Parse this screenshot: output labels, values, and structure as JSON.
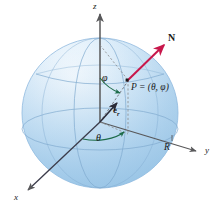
{
  "figure": {
    "name": "spherical-coordinate-sphere",
    "type": "diagram",
    "width": 218,
    "height": 217,
    "background": "#ffffff"
  },
  "colors": {
    "sphere_light": "#f2f8fd",
    "sphere_mid": "#cfe4f5",
    "sphere_deep": "#a9cdea",
    "sphere_edge": "#8fb9de",
    "grid_line": "#7fa9cf",
    "axis": "#58585a",
    "normal_vector": "#c8174b",
    "angle_arc": "#1d6b49",
    "label_text": "#1a1a1a",
    "dashed": "#8a8a8c"
  },
  "axes": [
    {
      "id": "z",
      "label": "z",
      "direction": "up",
      "label_x": 93,
      "label_y": 3
    },
    {
      "id": "y",
      "label": "y",
      "direction": "right-down",
      "label_x": 205,
      "label_y": 150
    },
    {
      "id": "x",
      "label": "x",
      "direction": "left-down",
      "label_x": 14,
      "label_y": 196
    }
  ],
  "labels": {
    "point": "P = (θ, φ)",
    "point_x": 130,
    "point_y": 86,
    "normal": "N",
    "normal_x": 168,
    "normal_y": 36,
    "unit_vector": "e",
    "unit_vector_sub": "r",
    "unit_vector_x": 112,
    "unit_vector_y": 109,
    "phi": "φ",
    "phi_x": 102,
    "phi_y": 78,
    "theta": "θ",
    "theta_x": 96,
    "theta_y": 136,
    "radius": "R",
    "radius_x": 164,
    "radius_y": 145
  },
  "geometry": {
    "sphere_center_x": 100,
    "sphere_center_y": 113,
    "sphere_radius_x": 78,
    "sphere_radius_y": 75,
    "origin_x": 100,
    "origin_y": 122,
    "point_p_x": 128,
    "point_p_y": 80,
    "normal_tip_x": 163,
    "normal_tip_y": 44
  },
  "elements": [
    {
      "name": "sphere-body",
      "kind": "shape"
    },
    {
      "name": "equator-ellipse",
      "kind": "grid"
    },
    {
      "name": "meridian-front",
      "kind": "grid"
    },
    {
      "name": "meridian-side",
      "kind": "grid"
    },
    {
      "name": "latitude-upper",
      "kind": "grid"
    },
    {
      "name": "z-axis",
      "kind": "axis"
    },
    {
      "name": "y-axis",
      "kind": "axis"
    },
    {
      "name": "x-axis",
      "kind": "axis"
    },
    {
      "name": "radius-line-to-p",
      "kind": "ray"
    },
    {
      "name": "normal-vector-arrow",
      "kind": "vector"
    },
    {
      "name": "unit-vector-er-arrow",
      "kind": "vector"
    },
    {
      "name": "dashed-drop-line",
      "kind": "construction"
    },
    {
      "name": "dashed-ground-line",
      "kind": "construction"
    },
    {
      "name": "phi-arc",
      "kind": "arc"
    },
    {
      "name": "theta-arc",
      "kind": "arc"
    }
  ]
}
